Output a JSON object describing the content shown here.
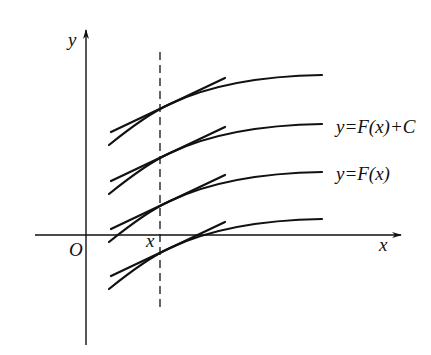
{
  "diagram": {
    "axis_labels": {
      "y": "y",
      "x": "x",
      "origin": "O",
      "x0": "x"
    },
    "curve_labels": {
      "shifted": "y=F(x)+C",
      "base": "y=F(x)"
    },
    "colors": {
      "ink": "#111111",
      "background": "#ffffff"
    },
    "geometry": {
      "y_axis_x": 86,
      "x_axis_y": 235,
      "dashed_line_x": 160,
      "curve_offset": 48,
      "curve_count": 4
    }
  }
}
